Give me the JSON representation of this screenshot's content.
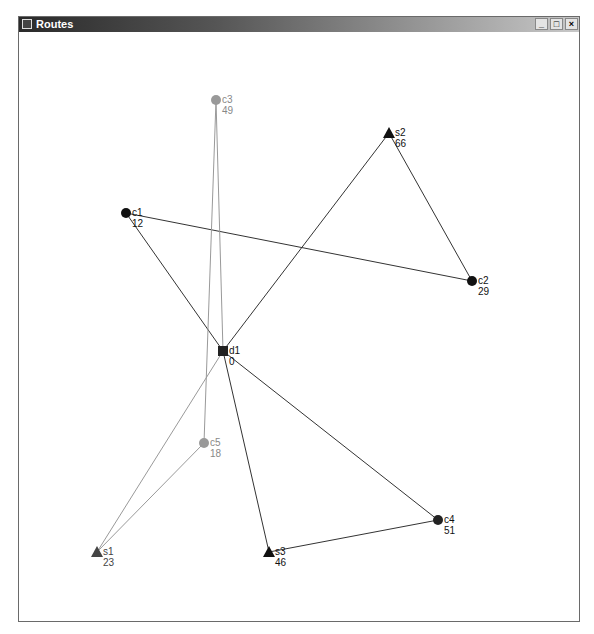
{
  "window": {
    "title": "Routes",
    "controls": {
      "minimize": "_",
      "maximize": "□",
      "close": "×"
    }
  },
  "graph": {
    "colors": {
      "dark": "#111111",
      "gray": "#999999",
      "s1": "#444444"
    },
    "nodes": [
      {
        "id": "c3",
        "label": "c3",
        "value": "49",
        "shape": "circle",
        "x": 215,
        "y": 99,
        "color": "#999999",
        "text_color": "#888888"
      },
      {
        "id": "s2",
        "label": "s2",
        "value": "66",
        "shape": "triangle",
        "x": 388,
        "y": 132,
        "color": "#111111",
        "text_color": "#111111"
      },
      {
        "id": "c1",
        "label": "c1",
        "value": "12",
        "shape": "circle",
        "x": 125,
        "y": 212,
        "color": "#111111",
        "text_color": "#111111"
      },
      {
        "id": "c2",
        "label": "c2",
        "value": "29",
        "shape": "circle",
        "x": 471,
        "y": 280,
        "color": "#111111",
        "text_color": "#111111"
      },
      {
        "id": "d1",
        "label": "d1",
        "value": "0",
        "shape": "square",
        "x": 222,
        "y": 350,
        "color": "#222222",
        "text_color": "#111111"
      },
      {
        "id": "c5",
        "label": "c5",
        "value": "18",
        "shape": "circle",
        "x": 203,
        "y": 442,
        "color": "#999999",
        "text_color": "#888888"
      },
      {
        "id": "c4",
        "label": "c4",
        "value": "51",
        "shape": "circle",
        "x": 437,
        "y": 519,
        "color": "#222222",
        "text_color": "#111111"
      },
      {
        "id": "s1",
        "label": "s1",
        "value": "23",
        "shape": "triangle",
        "x": 96,
        "y": 551,
        "color": "#444444",
        "text_color": "#444444"
      },
      {
        "id": "s3",
        "label": "s3",
        "value": "46",
        "shape": "triangle",
        "x": 268,
        "y": 551,
        "color": "#111111",
        "text_color": "#111111"
      }
    ],
    "edges": [
      {
        "from": "d1",
        "to": "c1",
        "color": "#333333"
      },
      {
        "from": "c1",
        "to": "c2",
        "color": "#333333"
      },
      {
        "from": "c2",
        "to": "s2",
        "color": "#333333"
      },
      {
        "from": "s2",
        "to": "d1",
        "color": "#333333"
      },
      {
        "from": "d1",
        "to": "s3",
        "color": "#333333"
      },
      {
        "from": "s3",
        "to": "c4",
        "color": "#333333"
      },
      {
        "from": "c4",
        "to": "d1",
        "color": "#333333"
      },
      {
        "from": "d1",
        "to": "c3",
        "color": "#999999"
      },
      {
        "from": "c3",
        "to": "c5",
        "color": "#999999"
      },
      {
        "from": "c5",
        "to": "s1",
        "color": "#999999"
      },
      {
        "from": "s1",
        "to": "d1",
        "color": "#999999"
      }
    ]
  }
}
